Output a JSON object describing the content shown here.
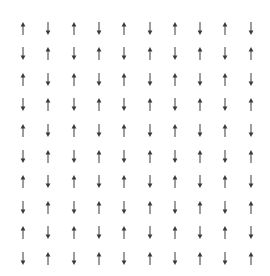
{
  "diagram": {
    "type": "spin-lattice",
    "rows": 10,
    "cols": 10,
    "origin": {
      "x": 23,
      "y": 28
    },
    "spacing": {
      "x": 25.3,
      "y": 25.6
    },
    "arrow_length": 13,
    "arrow_color": "#3a3a3a",
    "icon": "arrow-icon",
    "spins": [
      [
        "up",
        "down",
        "up",
        "down",
        "up",
        "down",
        "up",
        "down",
        "up",
        "down"
      ],
      [
        "down",
        "up",
        "down",
        "up",
        "down",
        "up",
        "down",
        "up",
        "down",
        "up"
      ],
      [
        "up",
        "down",
        "up",
        "down",
        "up",
        "down",
        "up",
        "down",
        "up",
        "down"
      ],
      [
        "down",
        "up",
        "down",
        "up",
        "down",
        "up",
        "down",
        "up",
        "down",
        "up"
      ],
      [
        "up",
        "down",
        "up",
        "down",
        "up",
        "down",
        "up",
        "down",
        "up",
        "down"
      ],
      [
        "down",
        "up",
        "down",
        "up",
        "down",
        "up",
        "down",
        "up",
        "down",
        "up"
      ],
      [
        "up",
        "down",
        "up",
        "down",
        "up",
        "down",
        "up",
        "down",
        "up",
        "down"
      ],
      [
        "down",
        "up",
        "down",
        "up",
        "down",
        "up",
        "down",
        "up",
        "down",
        "up"
      ],
      [
        "up",
        "down",
        "up",
        "down",
        "up",
        "down",
        "up",
        "down",
        "up",
        "down"
      ],
      [
        "down",
        "up",
        "down",
        "up",
        "down",
        "up",
        "down",
        "up",
        "down",
        "up"
      ]
    ]
  }
}
